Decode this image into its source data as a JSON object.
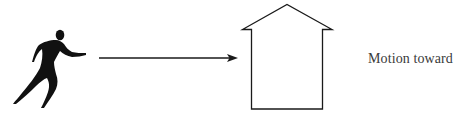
{
  "diagram": {
    "caption": "Motion toward",
    "elements": [
      {
        "id": "runner",
        "icon": "running-person-icon",
        "description": "black silhouette of a running person facing right"
      },
      {
        "id": "arrow",
        "icon": "right-arrow-icon",
        "description": "horizontal arrow pointing right toward the house"
      },
      {
        "id": "house",
        "icon": "house-outline-icon",
        "description": "outline of a house with a pointed roof"
      }
    ],
    "colors": {
      "ink": "#111111",
      "text": "#3a3a3a",
      "background": "#ffffff"
    }
  }
}
